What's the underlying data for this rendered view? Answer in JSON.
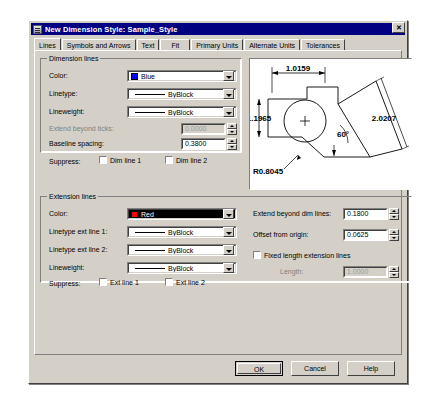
{
  "window": {
    "title": "New Dimension Style: Sample_Style",
    "icon": "dimension-style-icon",
    "close_label": "✕"
  },
  "tabs": [
    {
      "label": "Lines",
      "active": true
    },
    {
      "label": "Symbols and Arrows",
      "active": false
    },
    {
      "label": "Text",
      "active": false
    },
    {
      "label": "Fit",
      "active": false
    },
    {
      "label": "Primary Units",
      "active": false
    },
    {
      "label": "Alternate Units",
      "active": false
    },
    {
      "label": "Tolerances",
      "active": false
    }
  ],
  "dimension_lines": {
    "group_title": "Dimension lines",
    "color": {
      "label": "Color:",
      "value": "Blue",
      "swatch_hex": "#0000ff"
    },
    "linetype": {
      "label": "Linetype:",
      "value": "ByBlock"
    },
    "lineweight": {
      "label": "Lineweight:",
      "value": "ByBlock"
    },
    "extend_beyond_ticks": {
      "label": "Extend beyond ticks:",
      "value": "0.0000",
      "disabled": true
    },
    "baseline_spacing": {
      "label": "Baseline spacing:",
      "value": "0.3800",
      "disabled": false
    },
    "suppress": {
      "label": "Suppress:",
      "dim_line_1": "Dim line 1",
      "dim_line_2": "Dim line 2"
    }
  },
  "extension_lines": {
    "group_title": "Extension lines",
    "color": {
      "label": "Color:",
      "value": "Red",
      "swatch_hex": "#ff0000",
      "selected": true
    },
    "linetype_ext1": {
      "label": "Linetype ext line 1:",
      "value": "ByBlock"
    },
    "linetype_ext2": {
      "label": "Linetype ext line 2:",
      "value": "ByBlock"
    },
    "lineweight": {
      "label": "Lineweight:",
      "value": "ByBlock"
    },
    "suppress": {
      "label": "Suppress:",
      "ext_line_1": "Ext line 1",
      "ext_line_2": "Ext line 2"
    },
    "extend_beyond_dim_lines": {
      "label": "Extend beyond dim lines:",
      "value": "0.1800"
    },
    "offset_from_origin": {
      "label": "Offset from origin:",
      "value": "0.0625"
    },
    "fixed_length": {
      "label": "Fixed length extension lines",
      "checked": false
    },
    "length": {
      "label": "Length:",
      "value": "1.0000",
      "disabled": true
    }
  },
  "preview": {
    "name": "dimension-style-preview",
    "dimensions": {
      "top_horizontal": "1.0159",
      "left_vertical": "1.1965",
      "diagonal": "2.0207",
      "angle": "60°",
      "radius": "R0.8045"
    }
  },
  "buttons": {
    "ok": "OK",
    "cancel": "Cancel",
    "help": "Help"
  }
}
